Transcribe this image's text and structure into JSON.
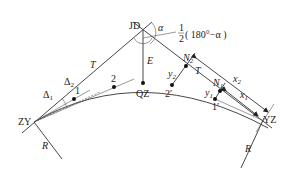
{
  "diagram": {
    "type": "circular curve layout by offset (tangent) method",
    "points": {
      "JD": "JD",
      "ZY": "ZY",
      "YZ": "YZ",
      "QZ": "QZ",
      "N1": "N",
      "N1_sub": "1",
      "N2": "N",
      "N2_sub": "2",
      "p1": "1",
      "p2": "2",
      "p1_prime": "1′",
      "p2_prime": "2′"
    },
    "labels": {
      "alpha": "α",
      "half_angle_num": "1",
      "half_angle_den": "2",
      "half_angle_expr": "( 180°−α )",
      "T_left": "T",
      "T_right": "T",
      "E": "E",
      "R_left": "R",
      "R_right": "R",
      "delta1": "Δ",
      "delta1_sub": "1",
      "delta2": "Δ",
      "delta2_sub": "2",
      "x1": "x",
      "x1_sub": "1",
      "x2": "x",
      "x2_sub": "2",
      "y1": "y",
      "y1_sub": "1",
      "y2": "y",
      "y2_sub": "2"
    }
  }
}
